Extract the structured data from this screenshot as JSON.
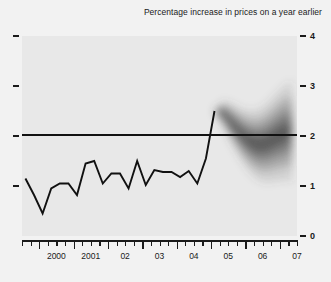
{
  "chart_title": "Percentage increase in prices on a year earlier",
  "colors": {
    "page_background": "#f2f2f2",
    "plot_background": "#e8e8e8",
    "line": "#111111",
    "target_line": "#111111",
    "fan": "#4a4a4a",
    "text": "#1a1a1a"
  },
  "axes": {
    "y_labels": [
      "4",
      "3",
      "2",
      "1",
      "0"
    ],
    "y_values": [
      4,
      3,
      2,
      1,
      0
    ],
    "x_labels": [
      "2000",
      "2001",
      "02",
      "03",
      "04",
      "05",
      "06",
      "07"
    ]
  },
  "chart_data": {
    "type": "line",
    "title": "Percentage increase in prices on a year earlier",
    "subtitle": "",
    "xlabel": "",
    "ylabel": "",
    "ylim": [
      0,
      4
    ],
    "xlim": [
      1999.5,
      2007.5
    ],
    "grid": false,
    "legend": "none",
    "annotations": [
      {
        "text": "Inflation target reference line at 2%",
        "type": "hline",
        "value": 2
      },
      {
        "text": "Fan chart projection region begins at 2005 Q1",
        "type": "region_start",
        "x": 2005.0
      }
    ],
    "x_tick_labels": [
      "2000",
      "2001",
      "02",
      "03",
      "04",
      "05",
      "06",
      "07"
    ],
    "x_tick_values": [
      2000,
      2001,
      2002,
      2003,
      2004,
      2005,
      2006,
      2007
    ],
    "y_tick_labels": [
      "0",
      "1",
      "2",
      "3",
      "4"
    ],
    "y_tick_values": [
      0,
      1,
      2,
      3,
      4
    ],
    "series": [
      {
        "name": "CPI inflation (actual)",
        "type": "line",
        "x": [
          1999.6,
          1999.85,
          2000.1,
          2000.35,
          2000.6,
          2000.85,
          2001.1,
          2001.35,
          2001.6,
          2001.85,
          2002.1,
          2002.35,
          2002.6,
          2002.85,
          2003.1,
          2003.35,
          2003.6,
          2003.85,
          2004.1,
          2004.35,
          2004.6,
          2004.85,
          2005.1
        ],
        "values": [
          1.15,
          0.82,
          0.45,
          0.95,
          1.05,
          1.05,
          0.82,
          1.45,
          1.5,
          1.05,
          1.25,
          1.25,
          0.95,
          1.5,
          1.02,
          1.32,
          1.28,
          1.28,
          1.18,
          1.3,
          1.05,
          1.55,
          2.5
        ]
      },
      {
        "name": "Central projection (fan centre)",
        "type": "fan",
        "x": [
          2005.1,
          2005.35,
          2005.6,
          2005.85,
          2006.1,
          2006.35,
          2006.6,
          2006.85,
          2007.1,
          2007.35
        ],
        "values": [
          2.5,
          2.45,
          2.25,
          2.05,
          1.9,
          1.82,
          1.85,
          1.95,
          2.05,
          2.1
        ],
        "bands": [
          {
            "probability": 0.1,
            "lower_offset": 0.08,
            "upper_offset": 0.08
          },
          {
            "probability": 0.3,
            "lower_offset": 0.25,
            "upper_offset": 0.25
          },
          {
            "probability": 0.5,
            "lower_offset": 0.45,
            "upper_offset": 0.45
          },
          {
            "probability": 0.7,
            "lower_offset": 0.7,
            "upper_offset": 0.7
          },
          {
            "probability": 0.9,
            "lower_offset": 1.0,
            "upper_offset": 1.0
          }
        ]
      }
    ]
  }
}
